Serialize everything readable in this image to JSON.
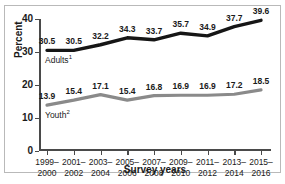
{
  "figure": {
    "top_caption": "",
    "bottom_caption": ""
  },
  "chart_data": {
    "type": "line",
    "title": "",
    "xlabel": "Survey years",
    "ylabel": "Percent",
    "ylim": [
      0,
      40
    ],
    "yticks": [
      0,
      10,
      20,
      30,
      40
    ],
    "ytick_labels": [
      "0",
      "10",
      "20",
      "30",
      "40"
    ],
    "grid": false,
    "legend_position": "inline-labels",
    "categories": [
      "1999–2000",
      "2001–2002",
      "2003–2004",
      "2005–2006",
      "2007–2008",
      "2009–2010",
      "2011–2012",
      "2013–2014",
      "2015–2016"
    ],
    "category_lines": [
      [
        "1999–",
        "2000"
      ],
      [
        "2001–",
        "2002"
      ],
      [
        "2003–",
        "2004"
      ],
      [
        "2005–",
        "2006"
      ],
      [
        "2007–",
        "2008"
      ],
      [
        "2009–",
        "2010"
      ],
      [
        "2011–",
        "2012"
      ],
      [
        "2013–",
        "2014"
      ],
      [
        "2015–",
        "2016"
      ]
    ],
    "series": [
      {
        "name": "Adults",
        "footnote_marker": "1",
        "color": "#161616",
        "values": [
          30.5,
          30.5,
          32.2,
          34.3,
          33.7,
          35.7,
          34.9,
          37.7,
          39.6
        ],
        "labels": [
          "30.5",
          "30.5",
          "32.2",
          "34.3",
          "33.7",
          "35.7",
          "34.9",
          "37.7",
          "39.6"
        ]
      },
      {
        "name": "Youth",
        "footnote_marker": "2",
        "color": "#8a8a8a",
        "values": [
          13.9,
          15.4,
          17.1,
          15.4,
          16.8,
          16.9,
          16.9,
          17.2,
          18.5
        ],
        "labels": [
          "13.9",
          "15.4",
          "17.1",
          "15.4",
          "16.8",
          "16.9",
          "16.9",
          "17.2",
          "18.5"
        ]
      }
    ]
  }
}
